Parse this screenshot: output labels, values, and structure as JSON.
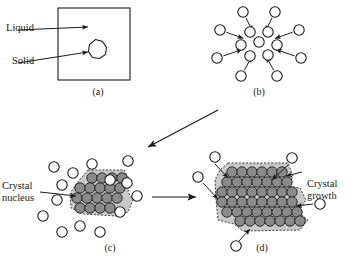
{
  "figure": {
    "colors": {
      "stroke": "#1a1a1a",
      "liquid_atom_fill": "#ffffff",
      "crystal_atom_fill": "#8a8a8a",
      "crystal_atom_stroke": "#2b2b2b",
      "crystal_halo_fill": "#c9c9c9",
      "background": "#ffffff",
      "text": "#1a1a1a"
    },
    "panels": [
      {
        "id": "a",
        "label": "(a)",
        "label_x": 98,
        "label_y": 86
      },
      {
        "id": "b",
        "label": "(b)",
        "label_x": 259,
        "label_y": 86
      },
      {
        "id": "c",
        "label": "(c)",
        "label_x": 110,
        "label_y": 242
      },
      {
        "id": "d",
        "label": "(d)",
        "label_x": 262,
        "label_y": 242
      }
    ],
    "callouts": [
      {
        "name": "liquid-label",
        "lines": [
          "Liquid"
        ],
        "x": 4,
        "y": 27,
        "align": "left-al"
      },
      {
        "name": "solid-label",
        "lines": [
          "Solid"
        ],
        "x": 4,
        "y": 60,
        "align": "left-al"
      },
      {
        "name": "crystal-nucleus-label",
        "lines": [
          "Crystal",
          "nucleus"
        ],
        "x": 2,
        "y": 182,
        "align": "left-al"
      },
      {
        "name": "crystal-growth-label",
        "lines": [
          "Crystal",
          "growth"
        ],
        "x": 310,
        "y": 180,
        "align": "right-al"
      }
    ],
    "panel_a": {
      "box": {
        "x": 58,
        "y": 8,
        "w": 72,
        "h": 72
      },
      "solid_polygon": "95.5,39.5 102.5,41.5 106.5,47.5 105.5,54.5 99.5,58.5 92.5,57.5 88.5,51.5 89.5,44.5",
      "liquid_arrow": {
        "x1": 18,
        "y1": 30,
        "x2": 88,
        "y2": 27
      },
      "solid_arrow": {
        "x1": 18,
        "y1": 63,
        "x2": 88,
        "y2": 52
      }
    },
    "panel_b": {
      "center": {
        "x": 259,
        "y": 44
      },
      "core_atoms": [
        {
          "x": 250,
          "y": 32
        },
        {
          "x": 268,
          "y": 32
        },
        {
          "x": 241,
          "y": 45
        },
        {
          "x": 259,
          "y": 42
        },
        {
          "x": 277,
          "y": 45
        },
        {
          "x": 250,
          "y": 56
        },
        {
          "x": 268,
          "y": 55
        }
      ],
      "outer_atoms": [
        {
          "x": 243,
          "y": 12
        },
        {
          "x": 275,
          "y": 12
        },
        {
          "x": 220,
          "y": 30
        },
        {
          "x": 299,
          "y": 30
        },
        {
          "x": 217,
          "y": 58
        },
        {
          "x": 301,
          "y": 58
        },
        {
          "x": 241,
          "y": 76
        },
        {
          "x": 277,
          "y": 76
        }
      ],
      "atom_radius": 5.2
    },
    "panel_c": {
      "crystal_atoms_rows": [
        {
          "y": 178,
          "xs": [
            92,
            102,
            112,
            122
          ]
        },
        {
          "y": 188,
          "xs": [
            80,
            90,
            100,
            110,
            120
          ]
        },
        {
          "y": 198,
          "xs": [
            77,
            87,
            97,
            107,
            117
          ]
        },
        {
          "y": 208,
          "xs": [
            80,
            90,
            100,
            110
          ]
        }
      ],
      "crystal_halo": "88,170 124,170 130,180 128,192 133,200 128,212 116,216 84,214 71,208 70,194 76,184",
      "liquid_atoms": [
        {
          "x": 54,
          "y": 167
        },
        {
          "x": 92,
          "y": 164
        },
        {
          "x": 128,
          "y": 161
        },
        {
          "x": 73,
          "y": 173
        },
        {
          "x": 110,
          "y": 180
        },
        {
          "x": 62,
          "y": 185
        },
        {
          "x": 127,
          "y": 183
        },
        {
          "x": 57,
          "y": 200
        },
        {
          "x": 137,
          "y": 196
        },
        {
          "x": 120,
          "y": 212
        },
        {
          "x": 80,
          "y": 226
        },
        {
          "x": 62,
          "y": 232
        },
        {
          "x": 100,
          "y": 232
        },
        {
          "x": 43,
          "y": 216
        }
      ],
      "atom_radius": 5.2,
      "nucleus_arrow": {
        "x1": 40,
        "y1": 192,
        "x2": 76,
        "y2": 196
      }
    },
    "panel_d": {
      "crystal_atoms_rows": [
        {
          "y": 172,
          "xs": [
            232,
            242,
            252,
            262,
            272,
            282
          ]
        },
        {
          "y": 182,
          "xs": [
            227,
            237,
            247,
            257,
            267,
            277,
            287
          ]
        },
        {
          "y": 192,
          "xs": [
            222,
            232,
            242,
            252,
            262,
            272,
            282,
            292
          ]
        },
        {
          "y": 202,
          "xs": [
            222,
            232,
            242,
            252,
            262,
            272,
            282,
            292
          ]
        },
        {
          "y": 212,
          "xs": [
            227,
            237,
            247,
            257,
            267,
            277,
            287,
            297
          ]
        },
        {
          "y": 221,
          "xs": [
            240,
            250,
            260,
            270,
            280,
            290,
            300
          ]
        }
      ],
      "crystal_halo": "228,163 288,163 293,176 288,186 300,188 306,200 298,212 308,220 300,230 243,231 234,224 218,220 216,200 215,180 220,170",
      "liquid_atoms": [
        {
          "x": 215,
          "y": 157
        },
        {
          "x": 198,
          "y": 177
        },
        {
          "x": 292,
          "y": 158
        },
        {
          "x": 320,
          "y": 204
        },
        {
          "x": 236,
          "y": 246
        }
      ],
      "atom_radius": 5.2,
      "growth_arrows": [
        {
          "x1": 215,
          "y1": 164,
          "x2": 228,
          "y2": 178
        },
        {
          "x1": 203,
          "y1": 183,
          "x2": 218,
          "y2": 199
        },
        {
          "x1": 288,
          "y1": 165,
          "x2": 272,
          "y2": 180
        },
        {
          "x1": 313,
          "y1": 204,
          "x2": 296,
          "y2": 206
        },
        {
          "x1": 239,
          "y1": 241,
          "x2": 250,
          "y2": 229
        }
      ],
      "growth_label_arrow": {
        "x1": 302,
        "y1": 172,
        "x2": 286,
        "y2": 176
      }
    },
    "transition_arrows": [
      {
        "name": "arrow-b-to-c",
        "x1": 218,
        "y1": 110,
        "x2": 148,
        "y2": 147
      },
      {
        "name": "arrow-c-to-d",
        "x1": 152,
        "y1": 197,
        "x2": 196,
        "y2": 197
      }
    ]
  }
}
